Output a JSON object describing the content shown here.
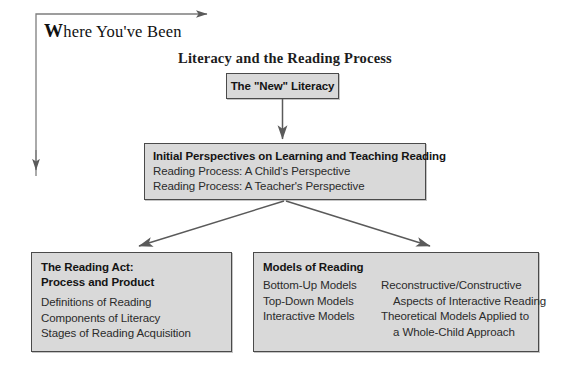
{
  "header": {
    "where_label_cap": "W",
    "where_label_rest": "here You've Been"
  },
  "section": {
    "title": "Literacy and the Reading Process"
  },
  "boxes": {
    "new_literacy": {
      "title": "The \"New\" Literacy"
    },
    "initial_perspectives": {
      "title": "Initial Perspectives on Learning and Teaching Reading",
      "lines": [
        "Reading Process: A Child's Perspective",
        "Reading Process: A Teacher's Perspective"
      ]
    },
    "reading_act": {
      "title_line1": "The Reading Act:",
      "title_line2": "Process and Product",
      "lines": [
        "Definitions of Reading",
        "Components of Literacy",
        "Stages of Reading Acquisition"
      ]
    },
    "models_of_reading": {
      "title": "Models of Reading",
      "left_column": [
        "Bottom-Up Models",
        "Top-Down Models",
        "Interactive Models"
      ],
      "right_column": [
        "Reconstructive/Constructive",
        "Aspects of Interactive Reading",
        "Theoretical Models Applied to",
        "a Whole-Child Approach"
      ]
    }
  },
  "colors": {
    "box_fill": "#d9d9d9",
    "box_border": "#4a4a4a",
    "arrow": "#5a5a5a",
    "text": "#1a1a1a",
    "page_background": "#ffffff"
  },
  "connectors": [
    {
      "name": "where-youve-been-path",
      "shape": "L-shaped corner with right arrow and down arrow"
    },
    {
      "name": "new-literacy-to-initial-perspectives",
      "shape": "vertical down arrow"
    },
    {
      "name": "initial-perspectives-to-reading-act",
      "shape": "diagonal down-left arrow"
    },
    {
      "name": "initial-perspectives-to-models",
      "shape": "diagonal down-right arrow"
    }
  ]
}
